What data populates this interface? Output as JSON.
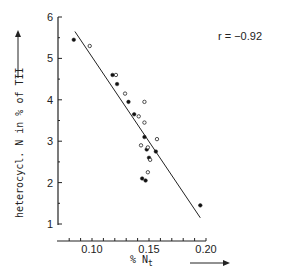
{
  "chart_data": {
    "type": "scatter",
    "title": "",
    "xlabel": "% N_t",
    "ylabel": "heterocycl. N in % of TII",
    "xlim": [
      0.08,
      0.2
    ],
    "ylim": [
      1,
      6
    ],
    "x_ticks": [
      "0.10",
      "0.15",
      "0.20"
    ],
    "x_tick_values": [
      0.1,
      0.15,
      0.2
    ],
    "y_ticks": [
      "1",
      "2",
      "3",
      "4",
      "5",
      "6"
    ],
    "y_tick_values": [
      1,
      2,
      3,
      4,
      5,
      6
    ],
    "grid": false,
    "legend": null,
    "annotations": [
      {
        "text": "r = −0.92",
        "position": "top-right"
      }
    ],
    "series": [
      {
        "name": "filled",
        "marker": "filled-circle",
        "points": [
          [
            0.084,
            5.45
          ],
          [
            0.118,
            4.6
          ],
          [
            0.122,
            4.38
          ],
          [
            0.132,
            3.95
          ],
          [
            0.137,
            3.65
          ],
          [
            0.146,
            3.1
          ],
          [
            0.148,
            2.8
          ],
          [
            0.15,
            2.6
          ],
          [
            0.156,
            2.75
          ],
          [
            0.144,
            2.1
          ],
          [
            0.147,
            2.05
          ],
          [
            0.195,
            1.45
          ]
        ]
      },
      {
        "name": "open",
        "marker": "open-circle",
        "points": [
          [
            0.098,
            5.3
          ],
          [
            0.121,
            4.6
          ],
          [
            0.129,
            4.15
          ],
          [
            0.141,
            3.6
          ],
          [
            0.146,
            3.95
          ],
          [
            0.146,
            3.45
          ],
          [
            0.157,
            3.05
          ],
          [
            0.149,
            2.85
          ],
          [
            0.151,
            2.55
          ],
          [
            0.149,
            2.25
          ],
          [
            0.143,
            2.9
          ]
        ]
      }
    ],
    "regression_line": {
      "x": [
        0.085,
        0.195
      ],
      "y": [
        5.65,
        1.15
      ],
      "r": -0.92
    }
  },
  "labels": {
    "annotation": "r = −0.92",
    "ylabel": "heterocycl. N in % of TII",
    "xlabel_main": "% N",
    "xlabel_sub": "t"
  }
}
